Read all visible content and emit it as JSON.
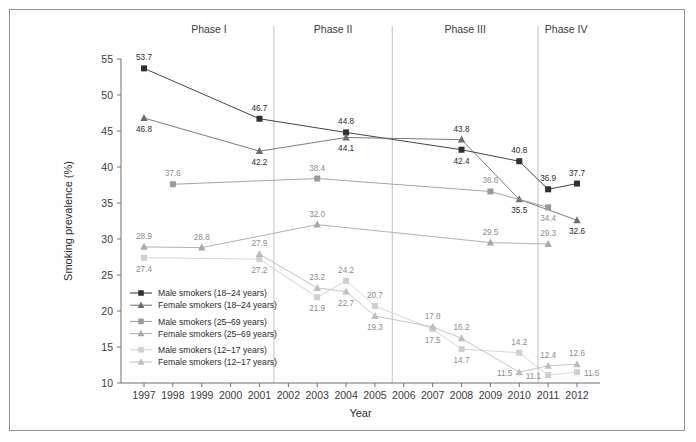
{
  "chart_data": {
    "type": "line",
    "title": "",
    "xlabel": "Year",
    "ylabel": "Smoking prevalence (%)",
    "x": [
      1997,
      1998,
      1999,
      2000,
      2001,
      2002,
      2003,
      2004,
      2005,
      2006,
      2007,
      2008,
      2009,
      2010,
      2011,
      2012
    ],
    "xticklabels": [
      "1997",
      "1998",
      "1999",
      "2000",
      "2001",
      "2002",
      "2003",
      "2004",
      "2005",
      "2006",
      "2007",
      "2008",
      "2009",
      "2010",
      "2011",
      "2012"
    ],
    "xlim": [
      1997,
      2012
    ],
    "ylim": [
      10,
      55
    ],
    "yticks": [
      10,
      15,
      20,
      25,
      30,
      35,
      40,
      45,
      50,
      55
    ],
    "yticklabels": [
      "10",
      "15",
      "20",
      "25",
      "30",
      "35",
      "40",
      "45",
      "50",
      "55"
    ],
    "grid": false,
    "legend_position": "inside-lower-left",
    "series": [
      {
        "name": "Male smokers (18–24 years)",
        "marker": "square",
        "color": "#2f2f2f",
        "points": [
          {
            "x": 1997,
            "y": 53.7,
            "label": "53.7",
            "pos": "above"
          },
          {
            "x": 2001,
            "y": 46.7,
            "label": "46.7",
            "pos": "above"
          },
          {
            "x": 2004,
            "y": 44.8,
            "label": "44.8",
            "pos": "above"
          },
          {
            "x": 2008,
            "y": 42.4,
            "label": "42.4",
            "pos": "below"
          },
          {
            "x": 2010,
            "y": 40.8,
            "label": "40.8",
            "pos": "above"
          },
          {
            "x": 2011,
            "y": 36.9,
            "label": "36.9",
            "pos": "above"
          },
          {
            "x": 2012,
            "y": 37.7,
            "label": "37.7",
            "pos": "above"
          }
        ]
      },
      {
        "name": "Female smokers (18–24 years)",
        "marker": "triangle",
        "color": "#6d6d6d",
        "points": [
          {
            "x": 1997,
            "y": 46.8,
            "label": "46.8",
            "pos": "below"
          },
          {
            "x": 2001,
            "y": 42.2,
            "label": "42.2",
            "pos": "below"
          },
          {
            "x": 2004,
            "y": 44.1,
            "label": "44.1",
            "pos": "below"
          },
          {
            "x": 2008,
            "y": 43.8,
            "label": "43.8",
            "pos": "above"
          },
          {
            "x": 2010,
            "y": 35.5,
            "label": "35.5",
            "pos": "below"
          },
          {
            "x": 2012,
            "y": 32.6,
            "label": "32.6",
            "pos": "below"
          }
        ]
      },
      {
        "name": "Male smokers (25–69 years)",
        "marker": "square",
        "color": "#9a9a9a",
        "points": [
          {
            "x": 1998,
            "y": 37.6,
            "label": "37.6",
            "pos": "above"
          },
          {
            "x": 2003,
            "y": 38.4,
            "label": "38.4",
            "pos": "above"
          },
          {
            "x": 2009,
            "y": 36.6,
            "label": "36.6",
            "pos": "above"
          },
          {
            "x": 2011,
            "y": 34.4,
            "label": "34.4",
            "pos": "below"
          }
        ]
      },
      {
        "name": "Female smokers (25–69 years)",
        "marker": "triangle",
        "color": "#a8a8a8",
        "points": [
          {
            "x": 1997,
            "y": 28.9,
            "label": "28.9",
            "pos": "above"
          },
          {
            "x": 1999,
            "y": 28.8,
            "label": "28.8",
            "pos": "above"
          },
          {
            "x": 2003,
            "y": 32.0,
            "label": "32.0",
            "pos": "above"
          },
          {
            "x": 2009,
            "y": 29.5,
            "label": "29.5",
            "pos": "above"
          },
          {
            "x": 2011,
            "y": 29.3,
            "label": "29.3",
            "pos": "above"
          }
        ]
      },
      {
        "name": "Male smokers (12–17 years)",
        "marker": "square",
        "color": "#cfcfcf",
        "points": [
          {
            "x": 1997,
            "y": 27.4,
            "label": "27.4",
            "pos": "below"
          },
          {
            "x": 2001,
            "y": 27.2,
            "label": "27.2",
            "pos": "below"
          },
          {
            "x": 2003,
            "y": 21.9,
            "label": "21.9",
            "pos": "below"
          },
          {
            "x": 2004,
            "y": 24.2,
            "label": "24.2",
            "pos": "above"
          },
          {
            "x": 2005,
            "y": 20.7,
            "label": "20.7",
            "pos": "above"
          },
          {
            "x": 2007,
            "y": 17.5,
            "label": "17.5",
            "pos": "below"
          },
          {
            "x": 2008,
            "y": 14.7,
            "label": "14.7",
            "pos": "below"
          },
          {
            "x": 2010,
            "y": 14.2,
            "label": "14.2",
            "pos": "above"
          },
          {
            "x": 2011,
            "y": 11.1,
            "label": "11.1",
            "pos": "left"
          },
          {
            "x": 2012,
            "y": 11.5,
            "label": "11.5",
            "pos": "right"
          }
        ]
      },
      {
        "name": "Female smokers (12–17 years)",
        "marker": "triangle",
        "color": "#bdbdbd",
        "points": [
          {
            "x": 2001,
            "y": 27.9,
            "label": "27.9",
            "pos": "above"
          },
          {
            "x": 2003,
            "y": 23.2,
            "label": "23.2",
            "pos": "above"
          },
          {
            "x": 2004,
            "y": 22.7,
            "label": "22.7",
            "pos": "below"
          },
          {
            "x": 2005,
            "y": 19.3,
            "label": "19.3",
            "pos": "below"
          },
          {
            "x": 2007,
            "y": 17.8,
            "label": "17.8",
            "pos": "above"
          },
          {
            "x": 2008,
            "y": 16.2,
            "label": "16.2",
            "pos": "above"
          },
          {
            "x": 2010,
            "y": 11.5,
            "label": "11.5",
            "pos": "left"
          },
          {
            "x": 2011,
            "y": 12.4,
            "label": "12.4",
            "pos": "above"
          },
          {
            "x": 2012,
            "y": 12.6,
            "label": "12.6",
            "pos": "above"
          }
        ]
      }
    ],
    "phases": [
      {
        "label": "Phase I",
        "start": 1997.0,
        "end": 2001.5
      },
      {
        "label": "Phase II",
        "start": 2001.5,
        "end": 2005.6
      },
      {
        "label": "Phase III",
        "start": 2005.6,
        "end": 2010.65
      },
      {
        "label": "Phase IV",
        "start": 2010.65,
        "end": 2012.6
      }
    ],
    "phase_dividers": [
      2001.5,
      2005.6,
      2010.65
    ],
    "colors": {
      "axis": "#6e6e6e",
      "text": "#2b2b2b",
      "divider": "#c2c2c2",
      "frame": "#8f8f8f",
      "background": "#ffffff"
    }
  }
}
